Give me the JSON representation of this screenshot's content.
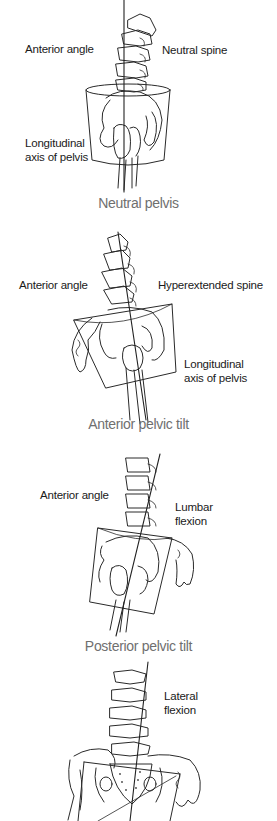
{
  "figure": {
    "panels": [
      {
        "id": "neutral",
        "caption": "Neutral pelvis",
        "labels": {
          "anterior_angle": "Anterior angle",
          "spine": "Neutral spine",
          "axis_line1": "Longitudinal",
          "axis_line2": "axis of pelvis"
        }
      },
      {
        "id": "anterior-tilt",
        "caption": "Anterior pelvic tilt",
        "labels": {
          "anterior_angle": "Anterior angle",
          "spine": "Hyperextended spine",
          "axis_line1": "Longitudinal",
          "axis_line2": "axis of pelvis"
        }
      },
      {
        "id": "posterior-tilt",
        "caption": "Posterior pelvic tilt",
        "labels": {
          "anterior_angle": "Anterior angle",
          "spine_line1": "Lumbar",
          "spine_line2": "flexion"
        }
      },
      {
        "id": "lateral",
        "caption": "",
        "labels": {
          "spine_line1": "Lateral",
          "spine_line2": "flexion"
        }
      }
    ],
    "colors": {
      "line_art": "#2a2a2a",
      "label_text": "#1a1a1a",
      "caption_text": "#6f6f6f",
      "background": "#ffffff"
    }
  }
}
